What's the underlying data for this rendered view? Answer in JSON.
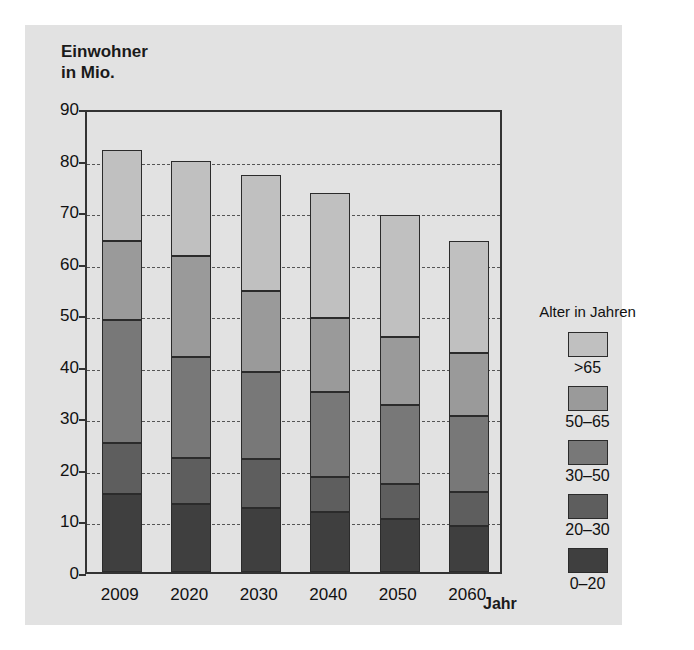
{
  "chart_data": {
    "type": "bar",
    "stacked": true,
    "title": "",
    "ylabel": "Einwohner in Mio.",
    "xlabel": "Jahr",
    "ylim": [
      0,
      90
    ],
    "ytick_step": 10,
    "yticks": [
      0,
      10,
      20,
      30,
      40,
      50,
      60,
      70,
      80,
      90
    ],
    "grid": true,
    "legend_position": "right",
    "legend_title": "Alter in Jahren",
    "categories": [
      "2009",
      "2020",
      "2030",
      "2040",
      "2050",
      "2060"
    ],
    "totals": [
      81.8,
      79.8,
      77.0,
      73.5,
      69.2,
      64.3
    ],
    "series": [
      {
        "name": "0–20",
        "color": "#3f3f3f",
        "values": [
          15.2,
          13.2,
          12.4,
          11.7,
          10.2,
          9.0
        ]
      },
      {
        "name": "20–30",
        "color": "#5e5e5e",
        "values": [
          9.8,
          8.9,
          9.5,
          6.7,
          6.9,
          6.6
        ]
      },
      {
        "name": "30–50",
        "color": "#787878",
        "values": [
          23.9,
          19.7,
          16.9,
          16.5,
          15.2,
          14.7
        ]
      },
      {
        "name": "50–65",
        "color": "#9a9a9a",
        "values": [
          15.3,
          19.4,
          15.7,
          14.3,
          13.3,
          12.2
        ]
      },
      {
        "name": ">65",
        "color": "#c0c0c0",
        "values": [
          17.6,
          18.6,
          22.5,
          24.3,
          23.6,
          21.8
        ]
      }
    ]
  },
  "legend": {
    "title": "Alter in Jahren",
    "items": [
      {
        "label": ">65",
        "color": "#c0c0c0"
      },
      {
        "label": "50–65",
        "color": "#9a9a9a"
      },
      {
        "label": "30–50",
        "color": "#787878"
      },
      {
        "label": "20–30",
        "color": "#5e5e5e"
      },
      {
        "label": "0–20",
        "color": "#3f3f3f"
      }
    ]
  },
  "axes": {
    "y_title": "Einwohner\nin Mio.",
    "x_title": "Jahr",
    "y_labels": [
      "90",
      "80",
      "70",
      "60",
      "50",
      "40",
      "30",
      "20",
      "10",
      "0"
    ],
    "x_labels": [
      "2009",
      "2020",
      "2030",
      "2040",
      "2050",
      "2060"
    ]
  },
  "colors": {
    "panel_background": "#e2e2e2",
    "page_background": "#ffffff",
    "axis": "#333333",
    "grid": "#555555",
    "text": "#111111"
  }
}
